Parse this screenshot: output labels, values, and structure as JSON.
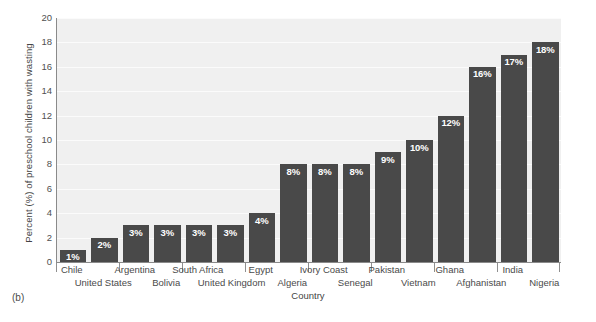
{
  "figure": {
    "panel_tag": "(b)"
  },
  "chart_data": {
    "type": "bar",
    "title": "",
    "xlabel": "Country",
    "ylabel": "Percent (%) of preschool children with wasting",
    "ylim": [
      0,
      20
    ],
    "ytick_step": 2,
    "yticks": [
      0,
      2,
      4,
      6,
      8,
      10,
      12,
      14,
      16,
      18,
      20
    ],
    "ytick_labels": [
      "0",
      "2",
      "4",
      "6",
      "8",
      "10",
      "12",
      "14",
      "16",
      "18",
      "20"
    ],
    "grid": true,
    "legend": "none",
    "bar_color": "#494949",
    "plot_background": "#f0f0f0",
    "value_label_suffix": "%",
    "categories": [
      "Chile",
      "United States",
      "Argentina",
      "Bolivia",
      "South Africa",
      "United Kingdom",
      "Egypt",
      "Algeria",
      "Ivory Coast",
      "Senegal",
      "Pakistan",
      "Vietnam",
      "Ghana",
      "Afghanistan",
      "India",
      "Nigeria"
    ],
    "values": [
      1,
      2,
      3,
      3,
      3,
      3,
      4,
      8,
      8,
      8,
      9,
      10,
      12,
      16,
      17,
      18
    ],
    "value_labels": [
      "1%",
      "2%",
      "3%",
      "3%",
      "3%",
      "3%",
      "4%",
      "8%",
      "8%",
      "8%",
      "9%",
      "10%",
      "12%",
      "16%",
      "17%",
      "18%"
    ],
    "label_rows": [
      0,
      1,
      0,
      1,
      0,
      1,
      0,
      1,
      0,
      1,
      0,
      1,
      0,
      1,
      0,
      1
    ]
  }
}
